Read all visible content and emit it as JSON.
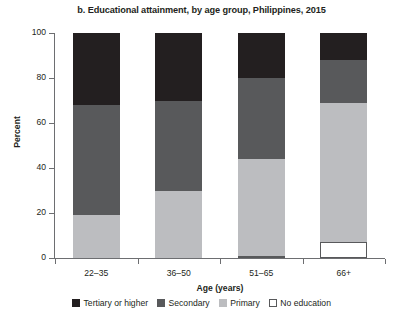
{
  "chart_data": {
    "type": "bar",
    "subtype": "stacked-bar-100",
    "title": "b. Educational attainment, by age group, Philippines, 2015",
    "xlabel": "Age (years)",
    "ylabel": "Percent",
    "categories": [
      "22–35",
      "36–50",
      "51–65",
      "66+"
    ],
    "ylim": [
      0,
      100
    ],
    "yticks": [
      0,
      20,
      40,
      60,
      80,
      100
    ],
    "ytick_labels": [
      "0",
      "20",
      "40",
      "60",
      "80",
      "100"
    ],
    "grid": false,
    "legend_position": "bottom",
    "stack_order_bottom_to_top": [
      "No education",
      "Primary",
      "Secondary",
      "Tertiary or higher"
    ],
    "series": [
      {
        "name": "No education",
        "color": "#ffffff",
        "border_color": "#58595b",
        "values": [
          0,
          0,
          1,
          7
        ]
      },
      {
        "name": "Primary",
        "color": "#bcbdc0",
        "values": [
          19,
          30,
          43,
          62
        ]
      },
      {
        "name": "Secondary",
        "color": "#58595b",
        "values": [
          49,
          40,
          36,
          19
        ]
      },
      {
        "name": "Tertiary or higher",
        "color": "#231f20",
        "values": [
          32,
          30,
          20,
          12
        ]
      }
    ],
    "cumulative_tops": {
      "22–35": [
        0,
        19,
        68,
        100
      ],
      "36–50": [
        0,
        30,
        70,
        100
      ],
      "51–65": [
        1,
        44,
        80,
        100
      ],
      "66+": [
        7,
        69,
        88,
        100
      ]
    },
    "legend": [
      {
        "label": "Tertiary or higher",
        "color": "#231f20",
        "outlined": false
      },
      {
        "label": "Secondary",
        "color": "#58595b",
        "outlined": false
      },
      {
        "label": "Primary",
        "color": "#bcbdc0",
        "outlined": false
      },
      {
        "label": "No education",
        "color": "#ffffff",
        "outlined": true
      }
    ]
  }
}
